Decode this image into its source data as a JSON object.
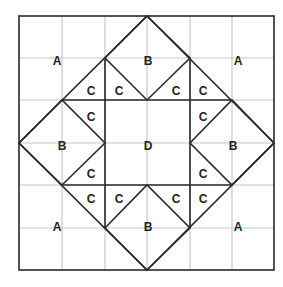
{
  "diagram": {
    "title": "",
    "grid": {
      "rows": 6,
      "cols": 6,
      "x0": 19,
      "y0": 16,
      "x1": 274,
      "y1": 270
    },
    "colors": {
      "grid": "#c8c8c8",
      "outline": "#2a2a2a",
      "label": "#222222",
      "background": "#ffffff"
    },
    "labels": [
      {
        "text": "A",
        "x": 57,
        "y": 62
      },
      {
        "text": "B",
        "x": 148,
        "y": 62
      },
      {
        "text": "A",
        "x": 238,
        "y": 62
      },
      {
        "text": "C",
        "x": 91,
        "y": 92
      },
      {
        "text": "C",
        "x": 119,
        "y": 92
      },
      {
        "text": "C",
        "x": 176,
        "y": 92
      },
      {
        "text": "C",
        "x": 203,
        "y": 92
      },
      {
        "text": "C",
        "x": 91,
        "y": 118
      },
      {
        "text": "C",
        "x": 203,
        "y": 118
      },
      {
        "text": "B",
        "x": 62,
        "y": 147
      },
      {
        "text": "D",
        "x": 148,
        "y": 147
      },
      {
        "text": "B",
        "x": 233,
        "y": 147
      },
      {
        "text": "C",
        "x": 91,
        "y": 175
      },
      {
        "text": "C",
        "x": 203,
        "y": 175
      },
      {
        "text": "C",
        "x": 91,
        "y": 200
      },
      {
        "text": "C",
        "x": 119,
        "y": 200
      },
      {
        "text": "C",
        "x": 176,
        "y": 200
      },
      {
        "text": "C",
        "x": 203,
        "y": 200
      },
      {
        "text": "A",
        "x": 57,
        "y": 228
      },
      {
        "text": "B",
        "x": 148,
        "y": 228
      },
      {
        "text": "A",
        "x": 238,
        "y": 228
      }
    ]
  }
}
